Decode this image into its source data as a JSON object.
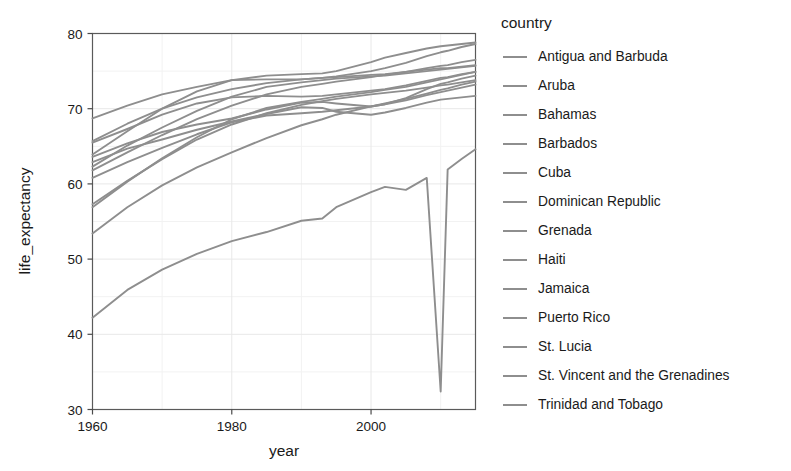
{
  "chart_data": {
    "type": "line",
    "title": "",
    "xlabel": "year",
    "ylabel": "life_expectancy",
    "xlim": [
      1960,
      2015
    ],
    "ylim": [
      30,
      80
    ],
    "xticks": [
      1960,
      1980,
      2000
    ],
    "yticks": [
      30,
      40,
      50,
      60,
      70,
      80
    ],
    "grid": true,
    "legend_position": "right",
    "legend_title": "country",
    "line_color": "#8e8e8e",
    "x": [
      1960,
      1965,
      1970,
      1975,
      1980,
      1985,
      1990,
      1993,
      1995,
      2000,
      2002,
      2005,
      2008,
      2010,
      2011,
      2013,
      2015
    ],
    "series": [
      {
        "name": "Antigua and Barbuda",
        "values": [
          61.8,
          64.2,
          66.5,
          68.6,
          70.4,
          71.9,
          72.9,
          73.3,
          73.6,
          74.2,
          74.5,
          74.9,
          75.4,
          75.7,
          75.8,
          76.2,
          76.5
        ]
      },
      {
        "name": "Aruba",
        "values": [
          65.7,
          68.0,
          70.0,
          71.5,
          72.6,
          73.4,
          73.9,
          74.1,
          74.2,
          74.5,
          74.6,
          74.9,
          75.2,
          75.4,
          75.4,
          75.6,
          75.8
        ]
      },
      {
        "name": "Bahamas",
        "values": [
          63.6,
          65.4,
          66.9,
          67.9,
          68.7,
          69.9,
          70.8,
          70.9,
          70.7,
          70.3,
          70.6,
          71.4,
          72.6,
          73.3,
          73.5,
          74.0,
          74.4
        ]
      },
      {
        "name": "Barbados",
        "values": [
          62.3,
          65.1,
          67.5,
          69.7,
          71.6,
          72.9,
          73.5,
          73.8,
          74.0,
          74.3,
          74.4,
          74.7,
          75.0,
          75.2,
          75.3,
          75.5,
          75.7
        ]
      },
      {
        "name": "Cuba",
        "values": [
          63.9,
          67.0,
          70.0,
          72.3,
          73.8,
          74.4,
          74.6,
          74.7,
          75.0,
          76.2,
          76.8,
          77.4,
          78.0,
          78.3,
          78.4,
          78.6,
          78.8
        ]
      },
      {
        "name": "Dominican Republic",
        "values": [
          53.4,
          56.9,
          59.8,
          62.2,
          64.2,
          66.1,
          67.8,
          68.6,
          69.2,
          70.3,
          70.7,
          71.3,
          72.0,
          72.5,
          72.7,
          73.2,
          73.6
        ]
      },
      {
        "name": "Grenada",
        "values": [
          57.3,
          60.4,
          63.3,
          65.9,
          67.9,
          69.4,
          70.5,
          71.0,
          71.3,
          71.9,
          72.1,
          72.4,
          72.8,
          73.1,
          73.2,
          73.5,
          73.8
        ]
      },
      {
        "name": "Haiti",
        "values": [
          42.2,
          45.9,
          48.6,
          50.7,
          52.4,
          53.6,
          55.1,
          55.4,
          56.9,
          58.9,
          59.6,
          59.2,
          60.8,
          32.4,
          61.9,
          63.3,
          64.6
        ]
      },
      {
        "name": "Jamaica",
        "values": [
          65.5,
          67.3,
          69.2,
          70.7,
          71.5,
          71.7,
          71.6,
          71.7,
          71.9,
          72.4,
          72.6,
          73.1,
          73.7,
          74.1,
          74.2,
          74.6,
          74.9
        ]
      },
      {
        "name": "Puerto Rico",
        "values": [
          68.7,
          70.4,
          71.9,
          72.9,
          73.8,
          73.9,
          73.9,
          74.1,
          74.3,
          75.0,
          75.4,
          76.1,
          77.0,
          77.5,
          77.7,
          78.2,
          78.6
        ]
      },
      {
        "name": "St. Lucia",
        "values": [
          56.9,
          60.3,
          63.4,
          66.2,
          68.6,
          70.1,
          70.9,
          71.3,
          71.6,
          72.2,
          72.5,
          72.9,
          73.5,
          73.9,
          74.1,
          74.5,
          74.9
        ]
      },
      {
        "name": "St. Vincent and the Grenadines",
        "values": [
          60.8,
          62.9,
          64.8,
          66.6,
          68.2,
          69.1,
          69.4,
          69.6,
          69.8,
          70.3,
          70.6,
          71.1,
          71.8,
          72.2,
          72.4,
          72.8,
          73.2
        ]
      },
      {
        "name": "Trinidad and Tobago",
        "values": [
          62.9,
          64.7,
          65.9,
          67.2,
          68.3,
          69.3,
          70.2,
          70.1,
          69.6,
          69.2,
          69.5,
          70.1,
          70.8,
          71.2,
          71.3,
          71.5,
          71.7
        ]
      }
    ]
  },
  "axes": {
    "xlabel": "year",
    "ylabel": "life_expectancy",
    "xtick_labels": [
      "1960",
      "1980",
      "2000"
    ],
    "ytick_labels": [
      "30",
      "40",
      "50",
      "60",
      "70",
      "80"
    ]
  },
  "legend": {
    "title": "country",
    "items": [
      {
        "label": "Antigua and Barbuda"
      },
      {
        "label": "Aruba"
      },
      {
        "label": "Bahamas"
      },
      {
        "label": "Barbados"
      },
      {
        "label": "Cuba"
      },
      {
        "label": "Dominican Republic"
      },
      {
        "label": "Grenada"
      },
      {
        "label": "Haiti"
      },
      {
        "label": "Jamaica"
      },
      {
        "label": "Puerto Rico"
      },
      {
        "label": "St. Lucia"
      },
      {
        "label": "St. Vincent and the Grenadines"
      },
      {
        "label": "Trinidad and Tobago"
      }
    ]
  }
}
